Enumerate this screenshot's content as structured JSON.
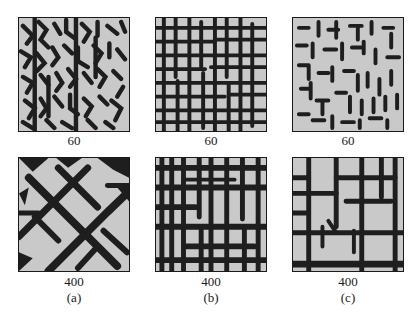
{
  "figure": {
    "columns": [
      {
        "id": "a",
        "sub_label": "(a)",
        "panels": [
          {
            "label": "60",
            "pattern": "dense-maze-diagonal-crosses"
          },
          {
            "label": "400",
            "pattern": "coarse-diagonal-stars"
          }
        ]
      },
      {
        "id": "b",
        "sub_label": "(b)",
        "panels": [
          {
            "label": "60",
            "pattern": "dense-orthogonal-grid"
          },
          {
            "label": "400",
            "pattern": "coarse-orthogonal-grid"
          }
        ]
      },
      {
        "id": "c",
        "sub_label": "(c)",
        "panels": [
          {
            "label": "60",
            "pattern": "dense-dashes-mixed"
          },
          {
            "label": "400",
            "pattern": "sparse-orthogonal-grid"
          }
        ]
      }
    ],
    "colors": {
      "background": "#ffffff",
      "texture_light": "#c9c9c9",
      "texture_dark": "#1e1e1e",
      "frame": "#1a1a1a"
    }
  }
}
